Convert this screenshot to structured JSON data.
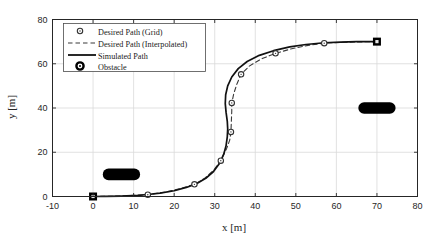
{
  "chart_data": {
    "type": "line",
    "title": "",
    "xlabel": "x [m]",
    "ylabel": "y [m]",
    "xlim": [
      -10,
      80
    ],
    "ylim": [
      0,
      80
    ],
    "xticks": [
      -10,
      0,
      10,
      20,
      30,
      40,
      50,
      60,
      70,
      80
    ],
    "yticks": [
      0,
      20,
      40,
      60,
      80
    ],
    "xticklabels": [
      "-10",
      "0",
      "10",
      "20",
      "30",
      "40",
      "50",
      "60",
      "70",
      "80"
    ],
    "yticklabels": [
      "0",
      "20",
      "40",
      "60",
      "80"
    ],
    "grid": true,
    "legend_position": "upper left",
    "series": [
      {
        "name": "Desired Path (Grid)",
        "style": "markers",
        "marker": "circle-open",
        "color": "#333333",
        "points": [
          [
            0.0,
            0.0
          ],
          [
            13.5,
            0.8
          ],
          [
            25.0,
            5.5
          ],
          [
            31.5,
            16.2
          ],
          [
            34.0,
            29.2
          ],
          [
            34.2,
            42.3
          ],
          [
            36.5,
            55.2
          ],
          [
            45.0,
            64.7
          ],
          [
            57.0,
            69.3
          ],
          [
            70.0,
            70.0
          ]
        ]
      },
      {
        "name": "Desired Path (Interpolated)",
        "style": "dashed",
        "color": "#3a3a3a",
        "points": [
          [
            0.0,
            0.0
          ],
          [
            4.0,
            0.1
          ],
          [
            8.0,
            0.3
          ],
          [
            13.5,
            0.8
          ],
          [
            18.0,
            2.0
          ],
          [
            22.0,
            3.8
          ],
          [
            25.0,
            5.5
          ],
          [
            27.5,
            8.2
          ],
          [
            29.8,
            12.0
          ],
          [
            31.5,
            16.2
          ],
          [
            32.9,
            21.5
          ],
          [
            33.7,
            25.5
          ],
          [
            34.0,
            29.2
          ],
          [
            34.1,
            34.0
          ],
          [
            34.2,
            38.5
          ],
          [
            34.2,
            42.3
          ],
          [
            34.7,
            46.5
          ],
          [
            35.5,
            51.0
          ],
          [
            36.5,
            55.2
          ],
          [
            38.5,
            58.9
          ],
          [
            41.5,
            62.2
          ],
          [
            45.0,
            64.7
          ],
          [
            49.0,
            66.8
          ],
          [
            53.0,
            68.3
          ],
          [
            57.0,
            69.3
          ],
          [
            61.5,
            69.7
          ],
          [
            66.0,
            69.9
          ],
          [
            70.0,
            70.0
          ]
        ]
      },
      {
        "name": "Simulated Path",
        "style": "solid",
        "color": "#111111",
        "points": [
          [
            0.0,
            0.0
          ],
          [
            3.0,
            0.05
          ],
          [
            7.0,
            0.2
          ],
          [
            11.0,
            0.5
          ],
          [
            13.5,
            0.9
          ],
          [
            16.5,
            1.5
          ],
          [
            20.0,
            2.6
          ],
          [
            23.0,
            4.1
          ],
          [
            25.5,
            5.8
          ],
          [
            27.8,
            8.2
          ],
          [
            29.7,
            11.3
          ],
          [
            31.2,
            15.0
          ],
          [
            32.2,
            19.0
          ],
          [
            32.8,
            23.0
          ],
          [
            33.1,
            27.0
          ],
          [
            33.2,
            30.5
          ],
          [
            33.1,
            34.0
          ],
          [
            32.8,
            38.0
          ],
          [
            32.6,
            42.0
          ],
          [
            32.7,
            46.0
          ],
          [
            33.2,
            50.0
          ],
          [
            34.2,
            54.0
          ],
          [
            35.8,
            57.8
          ],
          [
            38.0,
            61.0
          ],
          [
            41.0,
            63.8
          ],
          [
            44.5,
            65.9
          ],
          [
            48.5,
            67.6
          ],
          [
            52.5,
            68.7
          ],
          [
            57.0,
            69.5
          ],
          [
            61.0,
            69.8
          ],
          [
            65.0,
            70.0
          ],
          [
            70.0,
            70.0
          ]
        ]
      }
    ],
    "markers_special": [
      {
        "name": "start-waypoint",
        "x": 0.0,
        "y": 0.0,
        "shape": "filled-square-with-center",
        "color": "#000000"
      },
      {
        "name": "goal-waypoint",
        "x": 70.0,
        "y": 70.0,
        "shape": "filled-square-with-center",
        "color": "#000000"
      }
    ],
    "obstacles": [
      {
        "name": "obstacle-left",
        "cx": 7.0,
        "cy": 10.0,
        "rx": 4.6,
        "ry": 2.6,
        "color": "#000000"
      },
      {
        "name": "obstacle-right",
        "cx": 70.0,
        "cy": 40.0,
        "rx": 4.6,
        "ry": 2.6,
        "color": "#000000"
      }
    ]
  },
  "legend": {
    "entries": [
      {
        "label": "Desired Path (Grid)",
        "kind": "marker-circle"
      },
      {
        "label": "Desired Path (Interpolated)",
        "kind": "dashed-line"
      },
      {
        "label": "Simulated Path",
        "kind": "solid-line"
      },
      {
        "label": "Obstacle",
        "kind": "marker-bold-circle"
      }
    ]
  },
  "colors": {
    "axis": "#262626",
    "grid": "#d9d9d9",
    "obstacle": "#000000",
    "simulated": "#111111",
    "desired": "#3a3a3a",
    "background": "#ffffff"
  }
}
